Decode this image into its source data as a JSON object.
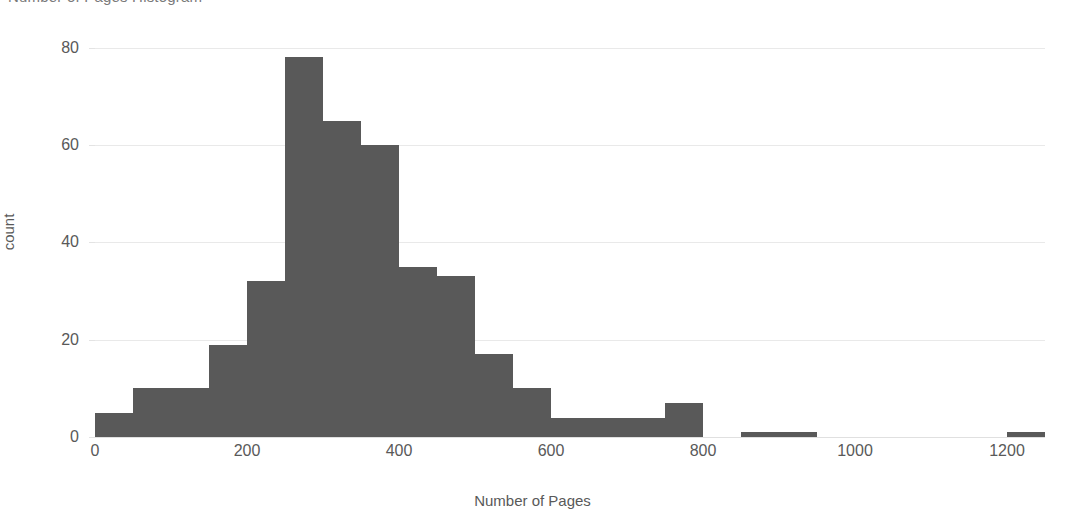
{
  "chart_data": {
    "type": "bar",
    "title": "Number of Pages Histogram",
    "xlabel": "Number of Pages",
    "ylabel": "count",
    "xlim": [
      0,
      1250
    ],
    "ylim": [
      0,
      82
    ],
    "grid": true,
    "legend": false,
    "bar_color": "#595959",
    "gridline_color": "#e9e9e9",
    "background_color": "#ffffff",
    "bin_width": 50,
    "xticks": [
      0,
      200,
      400,
      600,
      800,
      1000,
      1200
    ],
    "xtick_labels": [
      "0",
      "200",
      "400",
      "600",
      "800",
      "1000",
      "1200"
    ],
    "yticks": [
      0,
      20,
      40,
      60,
      80
    ],
    "ytick_labels": [
      "0",
      "20",
      "40",
      "60",
      "80"
    ],
    "bins": [
      {
        "start": 0,
        "end": 50,
        "count": 5
      },
      {
        "start": 50,
        "end": 100,
        "count": 10
      },
      {
        "start": 100,
        "end": 150,
        "count": 10
      },
      {
        "start": 150,
        "end": 200,
        "count": 19
      },
      {
        "start": 200,
        "end": 250,
        "count": 32
      },
      {
        "start": 250,
        "end": 300,
        "count": 78
      },
      {
        "start": 300,
        "end": 350,
        "count": 65
      },
      {
        "start": 350,
        "end": 400,
        "count": 60
      },
      {
        "start": 400,
        "end": 450,
        "count": 35
      },
      {
        "start": 450,
        "end": 500,
        "count": 33
      },
      {
        "start": 500,
        "end": 550,
        "count": 17
      },
      {
        "start": 550,
        "end": 600,
        "count": 10
      },
      {
        "start": 600,
        "end": 650,
        "count": 4
      },
      {
        "start": 650,
        "end": 700,
        "count": 4
      },
      {
        "start": 700,
        "end": 750,
        "count": 4
      },
      {
        "start": 750,
        "end": 800,
        "count": 7
      },
      {
        "start": 800,
        "end": 850,
        "count": 0
      },
      {
        "start": 850,
        "end": 900,
        "count": 1
      },
      {
        "start": 900,
        "end": 950,
        "count": 1
      },
      {
        "start": 950,
        "end": 1000,
        "count": 0
      },
      {
        "start": 1000,
        "end": 1050,
        "count": 0
      },
      {
        "start": 1050,
        "end": 1100,
        "count": 0
      },
      {
        "start": 1100,
        "end": 1150,
        "count": 0
      },
      {
        "start": 1150,
        "end": 1200,
        "count": 0
      },
      {
        "start": 1200,
        "end": 1250,
        "count": 1
      }
    ],
    "peak_bin": {
      "start": 250,
      "end": 300,
      "count": 78
    },
    "total_count": 400
  }
}
